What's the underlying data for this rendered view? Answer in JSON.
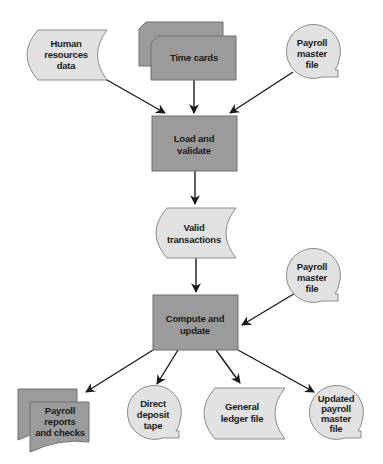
{
  "diagram": {
    "type": "system flowchart",
    "colors": {
      "process_fill": "#9b9b9b",
      "data_fill": "#e2e2e2",
      "outline": "#6e6e6e",
      "arrow": "#1a1a1a"
    },
    "nodes": {
      "hr_data": {
        "shape": "stored-data",
        "lines": [
          "Human",
          "resources",
          "data"
        ]
      },
      "time_cards": {
        "shape": "cards",
        "lines": [
          "Time cards"
        ]
      },
      "payroll_master_in": {
        "shape": "magnetic-tape",
        "lines": [
          "Payroll",
          "master",
          "file"
        ]
      },
      "load_validate": {
        "shape": "process",
        "lines": [
          "Load and",
          "validate"
        ]
      },
      "valid_transactions": {
        "shape": "stored-data",
        "lines": [
          "Valid",
          "transactions"
        ]
      },
      "payroll_master_in2": {
        "shape": "magnetic-tape",
        "lines": [
          "Payroll",
          "master",
          "file"
        ]
      },
      "compute_update": {
        "shape": "process",
        "lines": [
          "Compute and",
          "update"
        ]
      },
      "reports_checks": {
        "shape": "multi-document",
        "lines": [
          "Payroll",
          "reports",
          "and checks"
        ]
      },
      "direct_deposit": {
        "shape": "magnetic-tape",
        "lines": [
          "Direct",
          "deposit",
          "tape"
        ]
      },
      "general_ledger": {
        "shape": "stored-data",
        "lines": [
          "General",
          "ledger file"
        ]
      },
      "updated_master": {
        "shape": "magnetic-tape",
        "lines": [
          "Updated",
          "payroll",
          "master",
          "file"
        ]
      }
    },
    "edges": [
      [
        "hr_data",
        "load_validate"
      ],
      [
        "time_cards",
        "load_validate"
      ],
      [
        "payroll_master_in",
        "load_validate"
      ],
      [
        "load_validate",
        "valid_transactions"
      ],
      [
        "valid_transactions",
        "compute_update"
      ],
      [
        "payroll_master_in2",
        "compute_update"
      ],
      [
        "compute_update",
        "reports_checks"
      ],
      [
        "compute_update",
        "direct_deposit"
      ],
      [
        "compute_update",
        "general_ledger"
      ],
      [
        "compute_update",
        "updated_master"
      ]
    ]
  }
}
